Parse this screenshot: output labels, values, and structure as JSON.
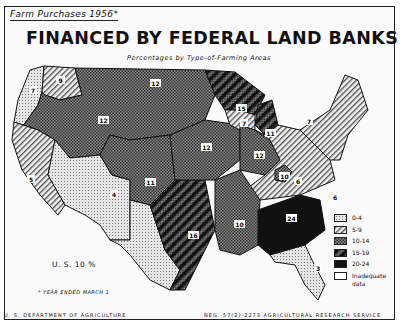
{
  "header": {
    "subtitle": "Farm Purchases 1956*",
    "title": "FINANCED BY FEDERAL LAND BANKS",
    "caption": "Percentages by Type-of-Farming Areas"
  },
  "summary": {
    "us_total": "U. S. 10 %",
    "footnote": "* YEAR ENDED MARCH 1"
  },
  "footer": {
    "left": "U. S. DEPARTMENT OF AGRICULTURE",
    "right": "NEG. 57(2)-2273   AGRICULTURAL RESEARCH SERVICE"
  },
  "legend": {
    "items": [
      {
        "label": "0-4",
        "pattern": "dots"
      },
      {
        "label": "5-9",
        "pattern": "diag"
      },
      {
        "label": "10-14",
        "pattern": "check"
      },
      {
        "label": "15-19",
        "pattern": "bold-diag"
      },
      {
        "label": "20-24",
        "pattern": "solid"
      },
      {
        "label": "Inadequate data",
        "pattern": "blank"
      }
    ]
  },
  "regions": [
    {
      "name": "pacific-northwest-west",
      "value": "7",
      "class": "0-4"
    },
    {
      "name": "pacific-northwest-east",
      "value": "9",
      "class": "5-9"
    },
    {
      "name": "northern-mountain-plains",
      "value": "12",
      "class": "10-14"
    },
    {
      "name": "california",
      "value": "5",
      "class": "5-9"
    },
    {
      "name": "southwest-mountain",
      "value": "4",
      "class": "0-4"
    },
    {
      "name": "southern-plains",
      "value": "11",
      "class": "10-14"
    },
    {
      "name": "central-plains",
      "value": "12",
      "class": "10-14"
    },
    {
      "name": "lake-states",
      "value": "15",
      "class": "15-19"
    },
    {
      "name": "wisconsin-south",
      "value": "7",
      "class": "5-9"
    },
    {
      "name": "corn-belt",
      "value": "12",
      "class": "10-14"
    },
    {
      "name": "eastern-corn-belt",
      "value": "11",
      "class": "5-9"
    },
    {
      "name": "texas-oklahoma",
      "value": "16",
      "class": "15-19"
    },
    {
      "name": "delta",
      "value": "10",
      "class": "10-14"
    },
    {
      "name": "kentucky-bluegrass",
      "value": "10",
      "class": "10-14"
    },
    {
      "name": "appalachian",
      "value": "6",
      "class": "5-9"
    },
    {
      "name": "northeast",
      "value": "7",
      "class": "5-9"
    },
    {
      "name": "virginia-carolina",
      "value": "6",
      "class": "5-9"
    },
    {
      "name": "southeast",
      "value": "24",
      "class": "20-24"
    },
    {
      "name": "florida",
      "value": "3",
      "class": "0-4"
    }
  ]
}
